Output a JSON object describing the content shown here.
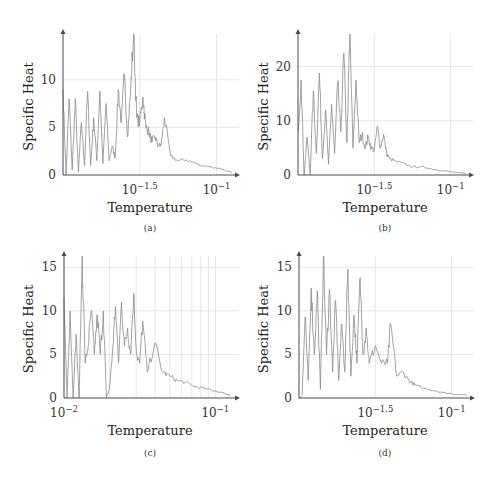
{
  "figure": {
    "panels": [
      "a",
      "b",
      "c",
      "d"
    ]
  },
  "chart_data": [
    {
      "id": "a",
      "type": "line",
      "caption": "(a)",
      "xlabel": "Temperature",
      "ylabel": "Specific Heat",
      "xscale": "log",
      "xlim_log10": [
        -2.0,
        -0.88
      ],
      "ylim": [
        0,
        14.8
      ],
      "yticks": [
        0,
        5,
        10
      ],
      "ytick_labels": [
        "0",
        "5",
        "10"
      ],
      "xticks_log10": [
        -1.5,
        -1
      ],
      "xtick_labels": [
        "10^-1.5",
        "10^-1"
      ],
      "grid": true,
      "series": [
        {
          "name": "Specific Heat",
          "x_log10": [
            -2.0,
            -1.98,
            -1.96,
            -1.94,
            -1.92,
            -1.9,
            -1.88,
            -1.86,
            -1.84,
            -1.82,
            -1.8,
            -1.78,
            -1.76,
            -1.74,
            -1.72,
            -1.7,
            -1.68,
            -1.66,
            -1.64,
            -1.62,
            -1.6,
            -1.58,
            -1.56,
            -1.54,
            -1.52,
            -1.5,
            -1.48,
            -1.46,
            -1.44,
            -1.42,
            -1.4,
            -1.38,
            -1.36,
            -1.34,
            -1.3,
            -1.25,
            -1.2,
            -1.15,
            -1.1,
            -1.05,
            -1.0,
            -0.95,
            -0.9
          ],
          "values": [
            9,
            0,
            8,
            0.5,
            8,
            0.3,
            5.5,
            1,
            8.8,
            1,
            6,
            1.5,
            8.8,
            1.2,
            7.5,
            1.5,
            3,
            1.8,
            9,
            5.5,
            10.5,
            4,
            8.8,
            14.8,
            6,
            5.5,
            8.2,
            5,
            4.5,
            3.5,
            4,
            3,
            3.2,
            6,
            2,
            1.5,
            1.6,
            1.3,
            1.0,
            0.9,
            0.7,
            0.5,
            0.25
          ]
        }
      ]
    },
    {
      "id": "b",
      "type": "line",
      "caption": "(b)",
      "xlabel": "Temperature",
      "ylabel": "Specific Heat",
      "xscale": "log",
      "xlim_log10": [
        -2.0,
        -0.88
      ],
      "ylim": [
        0,
        26
      ],
      "yticks": [
        0,
        10,
        20
      ],
      "ytick_labels": [
        "0",
        "10",
        "20"
      ],
      "xticks_log10": [
        -1.5,
        -1
      ],
      "xtick_labels": [
        "10^-1.5",
        "10^-1"
      ],
      "grid": true,
      "series": [
        {
          "name": "Specific Heat",
          "x_log10": [
            -2.0,
            -1.98,
            -1.96,
            -1.94,
            -1.92,
            -1.9,
            -1.88,
            -1.86,
            -1.84,
            -1.82,
            -1.8,
            -1.78,
            -1.76,
            -1.74,
            -1.72,
            -1.7,
            -1.68,
            -1.66,
            -1.64,
            -1.62,
            -1.6,
            -1.58,
            -1.56,
            -1.54,
            -1.52,
            -1.5,
            -1.48,
            -1.46,
            -1.44,
            -1.42,
            -1.4,
            -1.36,
            -1.3,
            -1.25,
            -1.2,
            -1.15,
            -1.1,
            -1.05,
            -1.0,
            -0.95,
            -0.9
          ],
          "values": [
            8,
            17.5,
            0,
            7,
            0,
            15.5,
            4,
            18.8,
            3,
            12,
            2,
            13,
            4,
            17,
            8,
            22.5,
            6,
            26,
            5,
            17.5,
            6,
            7.5,
            5,
            7,
            5,
            4.5,
            9,
            5,
            7.5,
            4,
            3,
            2.5,
            2,
            1.5,
            1.5,
            1.3,
            1.0,
            0.8,
            0.6,
            0.4,
            0.3
          ]
        }
      ]
    },
    {
      "id": "c",
      "type": "line",
      "caption": "(c)",
      "xlabel": "Temperature",
      "ylabel": "Specific Heat",
      "xscale": "log",
      "xlim_log10": [
        -2.0,
        -0.87
      ],
      "ylim": [
        0,
        16.3
      ],
      "yticks": [
        0,
        5,
        10,
        15
      ],
      "ytick_labels": [
        "0",
        "5",
        "10",
        "15"
      ],
      "xticks_log10": [
        -2,
        -1
      ],
      "xtick_labels": [
        "10^-2",
        "10^-1"
      ],
      "grid": true,
      "minor_grid": true,
      "series": [
        {
          "name": "Specific Heat",
          "x_log10": [
            -2.0,
            -1.98,
            -1.96,
            -1.94,
            -1.92,
            -1.9,
            -1.88,
            -1.86,
            -1.84,
            -1.82,
            -1.8,
            -1.78,
            -1.76,
            -1.74,
            -1.72,
            -1.7,
            -1.68,
            -1.66,
            -1.64,
            -1.62,
            -1.6,
            -1.58,
            -1.56,
            -1.54,
            -1.52,
            -1.5,
            -1.48,
            -1.45,
            -1.4,
            -1.35,
            -1.3,
            -1.25,
            -1.2,
            -1.15,
            -1.1,
            -1.05,
            -1.0,
            -0.95,
            -0.9
          ],
          "values": [
            11.5,
            0,
            10,
            0,
            7.3,
            0,
            16.3,
            4,
            6,
            10,
            5,
            9.5,
            5,
            10,
            0,
            1,
            5,
            10.5,
            4,
            11,
            6,
            8,
            5,
            12,
            5,
            4,
            8.8,
            3,
            6.3,
            3,
            2.5,
            2,
            1.8,
            1.4,
            1.2,
            1.0,
            0.8,
            0.6,
            0.3
          ]
        }
      ]
    },
    {
      "id": "d",
      "type": "line",
      "caption": "(d)",
      "xlabel": "Temperature",
      "ylabel": "Specific Heat",
      "xscale": "log",
      "xlim_log10": [
        -2.0,
        -0.88
      ],
      "ylim": [
        0,
        16.3
      ],
      "yticks": [
        0,
        5,
        10,
        15
      ],
      "ytick_labels": [
        "0",
        "5",
        "10",
        "15"
      ],
      "xticks_log10": [
        -1.5,
        -1
      ],
      "xtick_labels": [
        "10^-1.5",
        "10^-1"
      ],
      "grid": true,
      "series": [
        {
          "name": "Specific Heat",
          "x_log10": [
            -2.0,
            -1.98,
            -1.96,
            -1.94,
            -1.92,
            -1.9,
            -1.88,
            -1.86,
            -1.84,
            -1.82,
            -1.8,
            -1.78,
            -1.76,
            -1.74,
            -1.72,
            -1.7,
            -1.68,
            -1.66,
            -1.64,
            -1.62,
            -1.6,
            -1.58,
            -1.56,
            -1.54,
            -1.5,
            -1.46,
            -1.42,
            -1.4,
            -1.36,
            -1.32,
            -1.28,
            -1.24,
            -1.2,
            -1.15,
            -1.1,
            -1.05,
            -1.0,
            -0.95,
            -0.9
          ],
          "values": [
            0,
            0.3,
            9.3,
            2,
            12.6,
            5,
            12.3,
            1,
            16.3,
            5,
            12.5,
            3,
            11.2,
            2,
            8.5,
            3,
            14.8,
            2.5,
            9.5,
            4,
            13.8,
            5,
            8,
            4,
            6,
            4,
            4,
            8.5,
            2.5,
            3,
            2,
            1.5,
            1.2,
            1.0,
            0.8,
            0.6,
            0.5,
            0.4,
            0.3
          ]
        }
      ]
    }
  ],
  "labels": {
    "ylabel": "Specific Heat",
    "xlabel": "Temperature",
    "captions": [
      "(a)",
      "(b)",
      "(c)",
      "(d)"
    ]
  },
  "colors": {
    "curve": "#8a8a8a",
    "axis": "#4a4a4a",
    "grid": "#e6e6e6",
    "text": "#222222"
  }
}
